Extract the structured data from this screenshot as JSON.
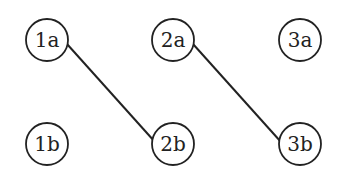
{
  "nodes": [
    {
      "id": "1a",
      "label": "1a",
      "cx": 47,
      "cy": 40
    },
    {
      "id": "2a",
      "label": "2a",
      "cx": 173,
      "cy": 40
    },
    {
      "id": "3a",
      "label": "3a",
      "cx": 300,
      "cy": 40
    },
    {
      "id": "1b",
      "label": "1b",
      "cx": 47,
      "cy": 144
    },
    {
      "id": "2b",
      "label": "2b",
      "cx": 173,
      "cy": 144
    },
    {
      "id": "3b",
      "label": "3b",
      "cx": 300,
      "cy": 144
    }
  ],
  "edges": [
    {
      "from": "1a",
      "to": "2b"
    },
    {
      "from": "2a",
      "to": "3b"
    }
  ],
  "style": {
    "stroke": "#222222",
    "background": "#ffffff",
    "radius": 21
  }
}
